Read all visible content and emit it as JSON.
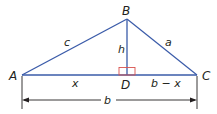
{
  "diagram": {
    "colors": {
      "triangle": "#3a5ba9",
      "right_angle_marker": "#d9534f",
      "dimension": "#231f20",
      "text": "#231f20"
    },
    "vertices": {
      "A": {
        "label": "A",
        "x": 22,
        "y": 75
      },
      "B": {
        "label": "B",
        "x": 127,
        "y": 19
      },
      "C": {
        "label": "C",
        "x": 197,
        "y": 75
      },
      "D": {
        "label": "D",
        "x": 127,
        "y": 75
      }
    },
    "segments": {
      "c": {
        "label": "c",
        "from": "A",
        "to": "B"
      },
      "a": {
        "label": "a",
        "from": "B",
        "to": "C"
      },
      "h": {
        "label": "h",
        "from": "B",
        "to": "D"
      },
      "x": {
        "label": "x",
        "from": "A",
        "to": "D"
      },
      "b_minus_x": {
        "label": "b − x",
        "from": "D",
        "to": "C"
      }
    },
    "dimension": {
      "label": "b",
      "from": "A",
      "to": "C"
    }
  }
}
